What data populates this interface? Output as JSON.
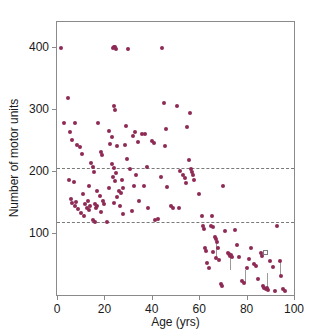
{
  "chart_data": {
    "type": "scatter",
    "title": "",
    "xlabel": "Age (yrs)",
    "ylabel": "Number of motor units",
    "xlim": [
      0,
      100
    ],
    "ylim": [
      0,
      440
    ],
    "grid": false,
    "legend": null,
    "xticks": [
      0,
      20,
      40,
      60,
      80,
      100
    ],
    "yticks": [
      100,
      200,
      300,
      400
    ],
    "xticklabels": [
      "0",
      "20",
      "40",
      "60",
      "80",
      "100"
    ],
    "yticklabels": [
      "100",
      "200",
      "300",
      "400"
    ],
    "marker_color": "#8e2a55",
    "annotations": [
      {
        "type": "hline",
        "y": 205,
        "style": "dashed",
        "label": ""
      },
      {
        "type": "hline",
        "y": 117,
        "style": "dashed",
        "label": ""
      }
    ],
    "series": [
      {
        "name": "Motor unit number estimate",
        "marker": "filled-circle",
        "points": [
          [
            1.5,
            398
          ],
          [
            4.5,
            318
          ],
          [
            3.0,
            278
          ],
          [
            5.5,
            262
          ],
          [
            6.5,
            250
          ],
          [
            7.5,
            277
          ],
          [
            5.0,
            185
          ],
          [
            7.0,
            182
          ],
          [
            8.5,
            242
          ],
          [
            9.5,
            238
          ],
          [
            6.0,
            155
          ],
          [
            6.5,
            148
          ],
          [
            7.5,
            143
          ],
          [
            8.0,
            150
          ],
          [
            9.0,
            139
          ],
          [
            10.5,
            228
          ],
          [
            11.0,
            163
          ],
          [
            12.0,
            146
          ],
          [
            12.5,
            141
          ],
          [
            13.0,
            152
          ],
          [
            13.5,
            137
          ],
          [
            14.0,
            144
          ],
          [
            10.0,
            132
          ],
          [
            11.5,
            128
          ],
          [
            14.5,
            212
          ],
          [
            15.0,
            207
          ],
          [
            15.5,
            198
          ],
          [
            13.5,
            176
          ],
          [
            16.0,
            146
          ],
          [
            16.5,
            140
          ],
          [
            17.0,
            143
          ],
          [
            15.0,
            121
          ],
          [
            16.0,
            118
          ],
          [
            17.5,
            277
          ],
          [
            18.5,
            231
          ],
          [
            19.0,
            226
          ],
          [
            17.0,
            168
          ],
          [
            18.0,
            160
          ],
          [
            19.5,
            152
          ],
          [
            20.0,
            147
          ],
          [
            18.5,
            133
          ],
          [
            21.0,
            118
          ],
          [
            22.0,
            265
          ],
          [
            23.0,
            255
          ],
          [
            23.5,
            398
          ],
          [
            24.0,
            399
          ],
          [
            24.5,
            400
          ],
          [
            25.0,
            397
          ],
          [
            24.0,
            305
          ],
          [
            24.5,
            298
          ],
          [
            22.5,
            243
          ],
          [
            25.5,
            240
          ],
          [
            23.0,
            211
          ],
          [
            24.0,
            205
          ],
          [
            25.0,
            197
          ],
          [
            23.5,
            190
          ],
          [
            24.5,
            184
          ],
          [
            22.0,
            172
          ],
          [
            26.0,
            168
          ],
          [
            25.5,
            158
          ],
          [
            24.0,
            148
          ],
          [
            27.0,
            164
          ],
          [
            28.0,
            172
          ],
          [
            26.5,
            144
          ],
          [
            30.0,
            397
          ],
          [
            29.0,
            273
          ],
          [
            28.5,
            241
          ],
          [
            29.5,
            219
          ],
          [
            31.0,
            203
          ],
          [
            27.5,
            186
          ],
          [
            28.0,
            131
          ],
          [
            32.0,
            257
          ],
          [
            33.0,
            262
          ],
          [
            34.0,
            247
          ],
          [
            33.5,
            194
          ],
          [
            32.5,
            176
          ],
          [
            34.5,
            152
          ],
          [
            31.5,
            135
          ],
          [
            36.0,
            260
          ],
          [
            37.0,
            259
          ],
          [
            38.0,
            207
          ],
          [
            36.5,
            176
          ],
          [
            38.5,
            141
          ],
          [
            40.0,
            249
          ],
          [
            41.0,
            245
          ],
          [
            41.5,
            121
          ],
          [
            42.5,
            122
          ],
          [
            44.5,
            398
          ],
          [
            45.0,
            310
          ],
          [
            46.0,
            268
          ],
          [
            45.5,
            240
          ],
          [
            44.0,
            190
          ],
          [
            46.5,
            174
          ],
          [
            48.0,
            143
          ],
          [
            49.0,
            141
          ],
          [
            50.5,
            305
          ],
          [
            52.0,
            200
          ],
          [
            51.5,
            141
          ],
          [
            53.0,
            194
          ],
          [
            54.0,
            188
          ],
          [
            54.5,
            181
          ],
          [
            55.0,
            271
          ],
          [
            56.0,
            294
          ],
          [
            55.5,
            217
          ],
          [
            56.5,
            203
          ],
          [
            57.0,
            199
          ],
          [
            57.5,
            193
          ],
          [
            58.0,
            185
          ],
          [
            61.0,
            128
          ],
          [
            61.5,
            112
          ],
          [
            62.0,
            107
          ],
          [
            62.5,
            75
          ],
          [
            63.0,
            71
          ],
          [
            63.5,
            52
          ],
          [
            64.0,
            44
          ],
          [
            60.0,
            163
          ],
          [
            65.0,
            112
          ],
          [
            66.0,
            110
          ],
          [
            66.5,
            94
          ],
          [
            67.0,
            90
          ],
          [
            67.5,
            86
          ],
          [
            68.0,
            75
          ],
          [
            66.0,
            70
          ],
          [
            67.0,
            60
          ],
          [
            68.5,
            57
          ],
          [
            69.0,
            17
          ],
          [
            69.5,
            15
          ],
          [
            65.5,
            127
          ],
          [
            70.0,
            176
          ],
          [
            71.0,
            103
          ],
          [
            72.0,
            68
          ],
          [
            72.5,
            66
          ],
          [
            73.0,
            63
          ],
          [
            73.5,
            64
          ],
          [
            74.0,
            61
          ],
          [
            75.0,
            104
          ],
          [
            76.0,
            80
          ],
          [
            77.0,
            62
          ],
          [
            78.0,
            22
          ],
          [
            79.0,
            19
          ],
          [
            80.0,
            44
          ],
          [
            81.0,
            58
          ],
          [
            82.0,
            76
          ],
          [
            83.0,
            50
          ],
          [
            84.0,
            47
          ],
          [
            85.0,
            25
          ],
          [
            86.0,
            68
          ],
          [
            86.5,
            63
          ],
          [
            87.0,
            14
          ],
          [
            87.5,
            11
          ],
          [
            88.0,
            10
          ],
          [
            88.5,
            12
          ],
          [
            89.0,
            8
          ],
          [
            90.0,
            54
          ],
          [
            91.0,
            45
          ],
          [
            92.0,
            7
          ],
          [
            93.0,
            112
          ],
          [
            94.0,
            55
          ],
          [
            94.5,
            30
          ],
          [
            95.5,
            9
          ],
          [
            96.0,
            7
          ]
        ]
      },
      {
        "name": "Open marker observation",
        "marker": "open-square",
        "points": [
          [
            88.0,
            68
          ]
        ]
      }
    ],
    "connectors": [
      {
        "x": 67.2,
        "y_top": 92,
        "y_bottom": 62
      },
      {
        "x": 73.2,
        "y_top": 66,
        "y_bottom": 40
      },
      {
        "x": 79.2,
        "y_top": 40,
        "y_bottom": 19
      },
      {
        "x": 88.5,
        "y_top": 35,
        "y_bottom": 11
      },
      {
        "x": 94.2,
        "y_top": 56,
        "y_bottom": 30
      }
    ]
  }
}
